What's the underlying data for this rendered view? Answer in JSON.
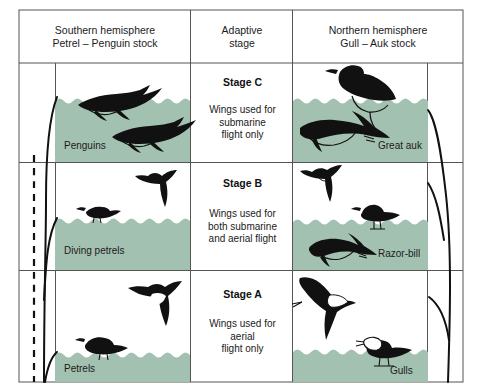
{
  "figure": {
    "water_color": "#a3c1b0",
    "line_color": "#555555",
    "silhouette_color": "#111111",
    "background": "#ffffff"
  },
  "headers": [
    {
      "line1": "Southern hemisphere",
      "line2": "Petrel – Penguin stock"
    },
    {
      "line1": "Adaptive",
      "line2": "stage"
    },
    {
      "line1": "Northern hemisphere",
      "line2": "Gull – Auk stock"
    }
  ],
  "rows": [
    {
      "stage": "Stage C",
      "desc_lines": [
        "Wings used for",
        "submarine",
        "flight only"
      ],
      "left_label": "Penguins",
      "right_label": "Great auk"
    },
    {
      "stage": "Stage B",
      "desc_lines": [
        "Wings used for",
        "both submarine",
        "and aerial flight"
      ],
      "left_label": "Diving petrels",
      "right_label": "Razor-bill"
    },
    {
      "stage": "Stage A",
      "desc_lines": [
        "Wings used for",
        "aerial",
        "flight only"
      ],
      "left_label": "Petrels",
      "right_label": "Gulls"
    }
  ],
  "caption": ""
}
